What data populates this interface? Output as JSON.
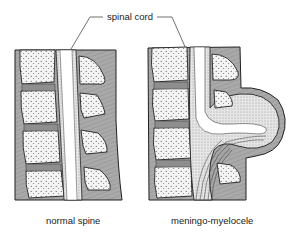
{
  "diagram": {
    "title_label": "spinal cord",
    "panels": [
      {
        "id": "normal",
        "caption": "normal spine"
      },
      {
        "id": "defect",
        "caption": "meningo-myelocele"
      }
    ],
    "colors": {
      "tissue": "#a9a9a9",
      "bone": "#f4f4f4",
      "outline": "#222222",
      "cord": "#ffffff",
      "disc": "#8e8e8e"
    }
  }
}
